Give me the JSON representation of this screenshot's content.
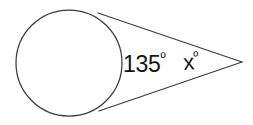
{
  "figure": {
    "background_color": "#ffffff",
    "stroke_color": "#3c3c3c",
    "text_color": "#141414",
    "width": 253,
    "height": 125
  },
  "labels": {
    "interior_angle": {
      "value": "135",
      "degree_symbol": "º",
      "full_text": "135º"
    },
    "exterior_angle": {
      "value": "x",
      "degree_symbol": "º",
      "full_text": "xº"
    }
  },
  "geometry": {
    "circle": {
      "center_x": 69,
      "center_y": 63,
      "radius": 53
    },
    "apex": {
      "x": 242,
      "y": 62
    },
    "upper_tangent_point": {
      "x": 98,
      "y": 13
    },
    "lower_tangent_point": {
      "x": 99,
      "y": 111
    }
  }
}
